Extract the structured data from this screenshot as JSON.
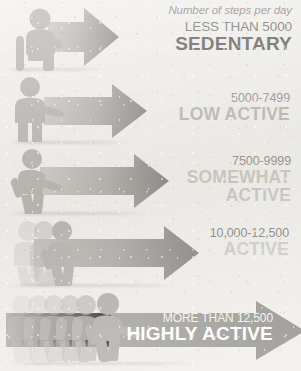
{
  "title": "Number of steps per day",
  "tiers": [
    {
      "steps": "LESS THAN 5000",
      "category": "SEDENTARY",
      "figure": "seated-person-icon",
      "arrow": "arrow-right-icon",
      "ghosts": 0
    },
    {
      "steps": "5000-7499",
      "category": "LOW ACTIVE",
      "figure": "standing-person-icon",
      "arrow": "arrow-right-icon",
      "ghosts": 0
    },
    {
      "steps": "7500-9999",
      "category": "SOMEWHAT ACTIVE",
      "category_line1": "SOMEWHAT",
      "category_line2": "ACTIVE",
      "figure": "walking-person-icon",
      "arrow": "arrow-right-icon",
      "ghosts": 0
    },
    {
      "steps": "10,000-12,500",
      "category": "ACTIVE",
      "figure": "walking-person-icon",
      "arrow": "arrow-right-icon",
      "ghosts": 2
    },
    {
      "steps": "MORE THAN 12,500",
      "category": "HIGHLY ACTIVE",
      "figure": "running-person-icon",
      "arrow": "arrow-right-icon",
      "ghosts": 5
    }
  ],
  "colors": {
    "background": "#edebe7",
    "arrow_light": "#b4b2ad",
    "arrow_dark": "#6f6d69",
    "figure": "#a8a6a1",
    "text_dark": "#3c3a36",
    "text_mid": "#7d7b76",
    "text_light": "#c3c1bc",
    "text_on_arrow": "#ffffff"
  }
}
